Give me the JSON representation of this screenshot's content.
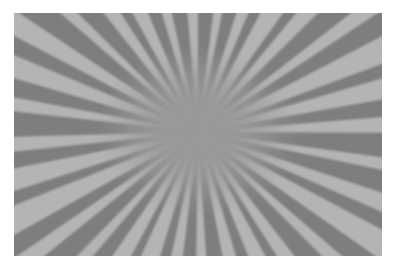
{
  "canvas": {
    "width": 396,
    "height": 270,
    "background_color": "#ffffff"
  },
  "image": {
    "title": "Radial sunburst ray pattern",
    "frame": {
      "x": 14,
      "y": 13,
      "width": 368,
      "height": 243
    },
    "background_color": "#999999"
  },
  "chart_data": {
    "type": "pie",
    "title": "",
    "subtitle": "",
    "xlabel": "",
    "ylabel": "",
    "legend": [],
    "annotations": [],
    "grid": false,
    "center": {
      "x_frac": 0.5,
      "y_frac": 0.49
    },
    "colors": {
      "light_ray": "#b4b4b4",
      "dark_ray": "#7e7e7e",
      "core": "#999999",
      "page_background": "#ffffff"
    },
    "core_radius_frac": 0.17,
    "ray_count": 64,
    "categories": [
      "ray-00",
      "ray-01",
      "ray-02",
      "ray-03",
      "ray-04",
      "ray-05",
      "ray-06",
      "ray-07",
      "ray-08",
      "ray-09",
      "ray-10",
      "ray-11",
      "ray-12",
      "ray-13",
      "ray-14",
      "ray-15",
      "ray-16",
      "ray-17",
      "ray-18",
      "ray-19",
      "ray-20",
      "ray-21",
      "ray-22",
      "ray-23",
      "ray-24",
      "ray-25",
      "ray-26",
      "ray-27",
      "ray-28",
      "ray-29",
      "ray-30",
      "ray-31",
      "ray-32",
      "ray-33",
      "ray-34",
      "ray-35",
      "ray-36",
      "ray-37",
      "ray-38",
      "ray-39",
      "ray-40",
      "ray-41",
      "ray-42",
      "ray-43",
      "ray-44",
      "ray-45",
      "ray-46",
      "ray-47",
      "ray-48",
      "ray-49",
      "ray-50",
      "ray-51",
      "ray-52",
      "ray-53",
      "ray-54",
      "ray-55",
      "ray-56",
      "ray-57",
      "ray-58",
      "ray-59",
      "ray-60",
      "ray-61",
      "ray-62",
      "ray-63"
    ],
    "values": [
      7.2,
      4.1,
      6.3,
      5.0,
      4.6,
      7.8,
      3.9,
      5.6,
      6.8,
      4.3,
      5.9,
      7.1,
      4.0,
      6.1,
      5.3,
      4.8,
      7.5,
      3.7,
      6.6,
      5.1,
      4.4,
      6.9,
      5.7,
      4.2,
      7.0,
      5.4,
      3.8,
      6.4,
      4.9,
      5.8,
      7.3,
      4.5,
      6.0,
      5.2,
      4.7,
      7.6,
      3.6,
      6.2,
      5.5,
      4.0,
      6.7,
      4.4,
      5.1,
      7.4,
      3.9,
      6.5,
      5.0,
      4.6,
      7.7,
      4.2,
      5.6,
      6.3,
      4.8,
      5.9,
      7.1,
      3.8,
      6.8,
      5.3,
      4.1,
      6.0,
      5.7,
      4.5,
      7.2,
      5.0
    ],
    "series": [
      {
        "name": "dark rays",
        "color": "#7e7e7e",
        "count": 32
      },
      {
        "name": "light rays",
        "color": "#b4b4b4",
        "count": 32
      }
    ],
    "ylim": [
      0,
      8
    ]
  }
}
